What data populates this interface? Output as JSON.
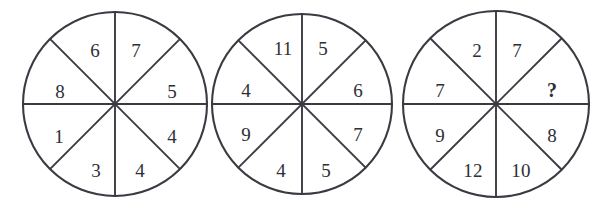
{
  "figure": {
    "background_color": "#ffffff",
    "line_color": "#3a3a42",
    "text_color": "#2e2e36",
    "unknown_symbol": "?"
  },
  "wheels": [
    {
      "name": "wheel-1",
      "cx": 115,
      "cy": 104,
      "r": 92,
      "sectors": [
        {
          "position": "top-left",
          "label": "6",
          "lx": 95,
          "ly": 50
        },
        {
          "position": "top-right",
          "label": "7",
          "lx": 136,
          "ly": 50
        },
        {
          "position": "right-upper",
          "label": "5",
          "lx": 172,
          "ly": 91
        },
        {
          "position": "right-lower",
          "label": "4",
          "lx": 172,
          "ly": 136
        },
        {
          "position": "bottom-right",
          "label": "4",
          "lx": 140,
          "ly": 170
        },
        {
          "position": "bottom-left",
          "label": "3",
          "lx": 96,
          "ly": 170
        },
        {
          "position": "left-lower",
          "label": "1",
          "lx": 59,
          "ly": 136
        },
        {
          "position": "left-upper",
          "label": "8",
          "lx": 60,
          "ly": 91
        }
      ]
    },
    {
      "name": "wheel-2",
      "cx": 302,
      "cy": 104,
      "r": 90,
      "sectors": [
        {
          "position": "top-left",
          "label": "11",
          "lx": 283,
          "ly": 48
        },
        {
          "position": "top-right",
          "label": "5",
          "lx": 323,
          "ly": 48
        },
        {
          "position": "right-upper",
          "label": "6",
          "lx": 358,
          "ly": 90
        },
        {
          "position": "right-lower",
          "label": "7",
          "lx": 358,
          "ly": 134
        },
        {
          "position": "bottom-right",
          "label": "5",
          "lx": 326,
          "ly": 170
        },
        {
          "position": "bottom-left",
          "label": "4",
          "lx": 281,
          "ly": 170
        },
        {
          "position": "left-lower",
          "label": "9",
          "lx": 246,
          "ly": 134
        },
        {
          "position": "left-upper",
          "label": "4",
          "lx": 246,
          "ly": 90
        }
      ]
    },
    {
      "name": "wheel-3",
      "cx": 496,
      "cy": 104,
      "r": 93,
      "sectors": [
        {
          "position": "top-left",
          "label": "2",
          "lx": 477,
          "ly": 50
        },
        {
          "position": "top-right",
          "label": "7",
          "lx": 517,
          "ly": 50
        },
        {
          "position": "right-upper",
          "label": "?",
          "lx": 552,
          "ly": 90,
          "unknown": true
        },
        {
          "position": "right-lower",
          "label": "8",
          "lx": 552,
          "ly": 135
        },
        {
          "position": "bottom-right",
          "label": "10",
          "lx": 521,
          "ly": 170
        },
        {
          "position": "bottom-left",
          "label": "12",
          "lx": 473,
          "ly": 170
        },
        {
          "position": "left-lower",
          "label": "9",
          "lx": 440,
          "ly": 135
        },
        {
          "position": "left-upper",
          "label": "7",
          "lx": 440,
          "ly": 90
        }
      ]
    }
  ]
}
